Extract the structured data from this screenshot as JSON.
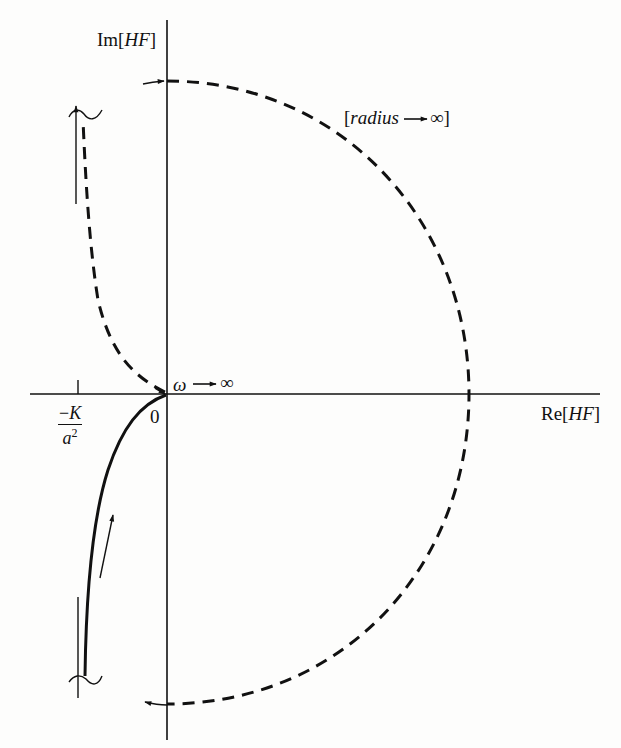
{
  "diagram": {
    "type": "nyquist-plot",
    "colors": {
      "ink": "#111111",
      "background": "#fdfdfc"
    },
    "axes": {
      "imag_label_prefix": "Im[",
      "imag_label_var": "HF",
      "imag_label_suffix": "]",
      "real_label_prefix": "Re[",
      "real_label_var": "HF",
      "real_label_suffix": "]",
      "origin_label": "0"
    },
    "annotations": {
      "omega_symbol": "ω",
      "omega_arrow": "→",
      "omega_limit": "∞",
      "radius_open": "[",
      "radius_word": "radius",
      "radius_arrow": "→",
      "radius_limit": "∞",
      "radius_close": "]",
      "critical_point_minus": "−",
      "critical_point_numerator": "K",
      "critical_point_denominator": "a",
      "critical_point_exponent": "2"
    },
    "curves": [
      {
        "name": "positive-frequency branch",
        "style": "solid",
        "description": "from -j∞ (near Re=-K/a²) curving up into origin"
      },
      {
        "name": "negative-frequency branch",
        "style": "dashed",
        "description": "from origin curving up to +j∞ near Re=-K/a²"
      },
      {
        "name": "infinite-radius semicircle",
        "style": "dashed",
        "description": "closing arc from +j∞ clockwise through positive real axis to -j∞"
      }
    ]
  }
}
